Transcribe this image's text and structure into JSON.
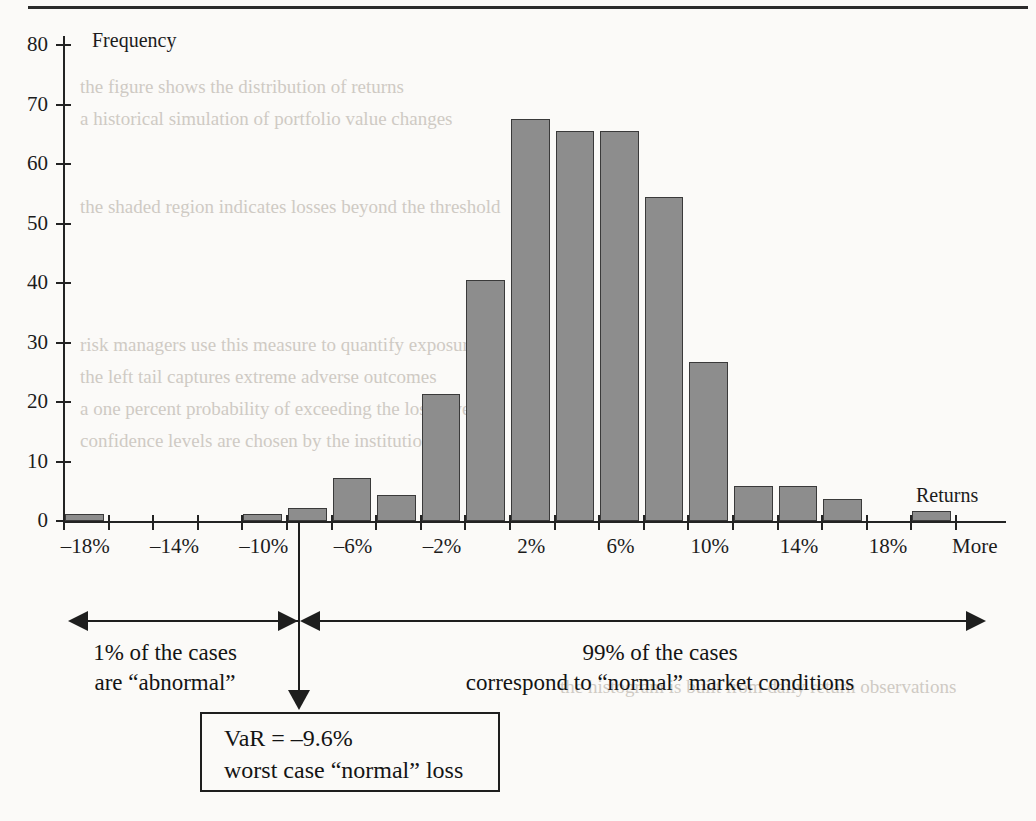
{
  "figure": {
    "frequency_axis_title": "Frequency",
    "returns_axis_title": "Returns",
    "more_label": "More"
  },
  "annotations": {
    "left_line1": "1% of the cases",
    "left_line2": "are “abnormal”",
    "right_line1": "99% of the cases",
    "right_line2": "correspond to “normal” market conditions",
    "var_box_line1": "VaR = –9.6%",
    "var_box_line2": "worst case “normal” loss"
  },
  "colors": {
    "bar_fill": "#8d8d8d",
    "bar_stroke": "#3a3a3a",
    "axis": "#232323",
    "text": "#141414"
  },
  "chart_data": {
    "type": "bar",
    "title": "",
    "xlabel": "Returns",
    "ylabel": "Frequency",
    "ylim": [
      0,
      80
    ],
    "grid": false,
    "legend": null,
    "ytick_labels": [
      "0",
      "10",
      "20",
      "30",
      "40",
      "50",
      "60",
      "70",
      "80"
    ],
    "ytick_values": [
      0,
      10,
      20,
      30,
      40,
      50,
      60,
      70,
      80
    ],
    "xtick_labels": [
      "–18%",
      "–14%",
      "–10%",
      "–6%",
      "–2%",
      "2%",
      "6%",
      "10%",
      "14%",
      "18%",
      "More"
    ],
    "bin_centers": [
      -18,
      -16,
      -14,
      -12,
      -10,
      -8,
      -6,
      -4,
      -2,
      0,
      2,
      4,
      6,
      8,
      10,
      12,
      14,
      16,
      18,
      20
    ],
    "categories": [
      "–18%",
      "–16%",
      "–14%",
      "–12%",
      "–10%",
      "–8%",
      "–6%",
      "–4%",
      "–2%",
      "0%",
      "2%",
      "4%",
      "6%",
      "8%",
      "10%",
      "12%",
      "14%",
      "16%",
      "18%",
      "More"
    ],
    "values": [
      1.2,
      0,
      0,
      0,
      1.2,
      2.2,
      7.3,
      4.3,
      21.3,
      40.5,
      67.5,
      65.6,
      65.6,
      54.5,
      26.7,
      5.8,
      5.8,
      3.7,
      0,
      1.7
    ],
    "annotations": [
      {
        "text": "VaR = –9.6%",
        "x": -9.6
      },
      {
        "text": "1% of the cases are “abnormal”",
        "range": [
          -20,
          -9.6
        ]
      },
      {
        "text": "99% of the cases correspond to “normal” market conditions",
        "range": [
          -9.6,
          21
        ]
      }
    ]
  },
  "ghost_text": {
    "lines": [
      "the figure shows the distribution of returns",
      "a historical simulation of portfolio value changes",
      "the shaded region indicates losses beyond the threshold",
      "risk managers use this measure to quantify exposure",
      "the left tail captures extreme adverse outcomes",
      "a one percent probability of exceeding the loss level",
      "confidence levels are chosen by the institution",
      "the histogram is built from daily return observations"
    ]
  }
}
